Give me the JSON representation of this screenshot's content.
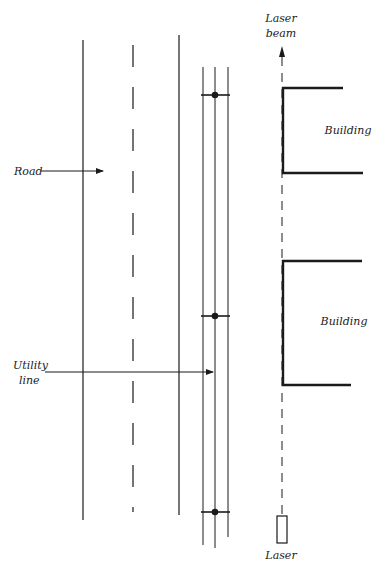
{
  "figure": {
    "type": "schematic",
    "colors": {
      "line": "#1a1a1a",
      "background": "#ffffff"
    },
    "labels": {
      "laser_beam_line1": "Laser",
      "laser_beam_line2": "beam",
      "building_top": "Building",
      "building_bottom": "Building",
      "road": "Road",
      "utility_line1": "Utility",
      "utility_line2": "line",
      "laser": "Laser"
    },
    "elements": {
      "road": {
        "edges": 2,
        "centerline": "dashed"
      },
      "utility_line": {
        "wires": 3,
        "poles": 3
      },
      "buildings": 2,
      "laser": {
        "beam": "dashed",
        "direction": "up"
      }
    }
  }
}
